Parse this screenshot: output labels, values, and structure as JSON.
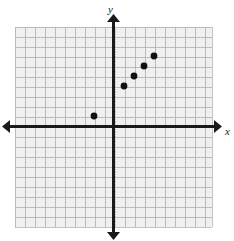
{
  "figure": {
    "kind": "coordinate-plane-scatter",
    "background_color": "#ffffff",
    "grid_fill_color": "#f0f0f0",
    "grid_line_color": "#b9b9b9",
    "axis_color": "#1a1a1a",
    "point_color": "#111111",
    "x_axis_label": "x",
    "y_axis_label": "y",
    "grid_cell_px": 10,
    "point_radius_px": 3.4
  },
  "chart_data": {
    "type": "scatter",
    "title": "",
    "xlabel": "x",
    "ylabel": "y",
    "grid": true,
    "legend": null,
    "xlim": [
      -10,
      10
    ],
    "ylim": [
      -10,
      10
    ],
    "xticks": [
      -10,
      -9,
      -8,
      -7,
      -6,
      -5,
      -4,
      -3,
      -2,
      -1,
      0,
      1,
      2,
      3,
      4,
      5,
      6,
      7,
      8,
      9,
      10
    ],
    "yticks": [
      -10,
      -9,
      -8,
      -7,
      -6,
      -5,
      -4,
      -3,
      -2,
      -1,
      0,
      1,
      2,
      3,
      4,
      5,
      6,
      7,
      8,
      9,
      10
    ],
    "xtick_labels": [],
    "ytick_labels": [],
    "x": [
      -2,
      1,
      2,
      3,
      4
    ],
    "y": [
      1,
      4,
      5,
      6,
      7
    ],
    "points": [
      {
        "x": -2,
        "y": 1
      },
      {
        "x": 1,
        "y": 4
      },
      {
        "x": 2,
        "y": 5
      },
      {
        "x": 3,
        "y": 6
      },
      {
        "x": 4,
        "y": 7
      }
    ],
    "annotations": []
  },
  "geometry": {
    "origin_px": {
      "x": 114,
      "y": 126
    },
    "grid_rect_px": {
      "left": 15,
      "top": 27,
      "right": 212,
      "bottom": 227
    },
    "x_axis_arrow_left_px": 8,
    "x_axis_arrow_right_px": 218,
    "y_axis_arrow_top_px": 16,
    "y_axis_arrow_bottom_px": 236,
    "x_label_px": {
      "x": 227,
      "y": 134
    },
    "y_label_px": {
      "x": 112,
      "y": 11
    }
  }
}
